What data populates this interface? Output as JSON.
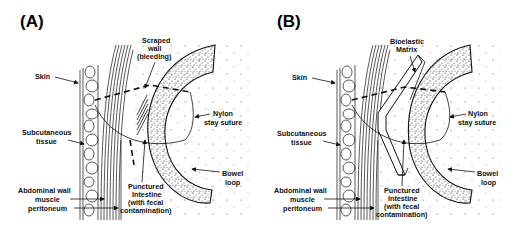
{
  "panels": [
    {
      "id": "A",
      "title": "(A)",
      "labels": {
        "skin": "Skin",
        "subcutaneous_1": "Subcutaneous",
        "subcutaneous_2": "tissue",
        "abdominal_1": "Abdominal wall",
        "abdominal_2": "muscle",
        "abdominal_3": "peritoneum",
        "scraped_1": "Scraped",
        "scraped_2": "wall",
        "scraped_3": "(bleeding)",
        "nylon_1": "Nylon",
        "nylon_2": "stay suture",
        "bowel_1": "Bowel",
        "bowel_2": "loop",
        "punctured_1": "Punctured",
        "punctured_2": "Intestine",
        "punctured_3": "(with fecal",
        "punctured_4": "contamination)"
      }
    },
    {
      "id": "B",
      "title": "(B)",
      "labels": {
        "skin": "Skin",
        "subcutaneous_1": "Subcutaneous",
        "subcutaneous_2": "tissue",
        "abdominal_1": "Abdominal wall",
        "abdominal_2": "muscle",
        "abdominal_3": "peritoneum",
        "matrix_1": "Bioelastic",
        "matrix_2": "Matrix",
        "nylon_1": "Nylon",
        "nylon_2": "stay suture",
        "bowel_1": "Bowel",
        "bowel_2": "loop",
        "punctured_1": "Punctured",
        "punctured_2": "Intestine",
        "punctured_3": "(with fecal",
        "punctured_4": "contamination)"
      }
    }
  ]
}
